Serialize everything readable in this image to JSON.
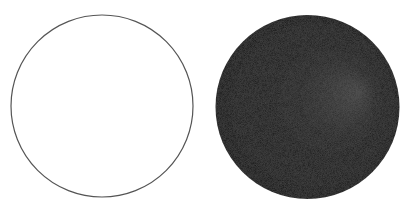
{
  "figure": {
    "width": 411,
    "height": 215,
    "background": "#ffffff",
    "shapes": [
      {
        "kind": "outline-circle",
        "cx": 102,
        "cy": 106,
        "r": 91,
        "fill": "#ffffff",
        "stroke": "#555555",
        "stroke_width": 1.2
      },
      {
        "kind": "shaded-sphere",
        "cx": 307.5,
        "cy": 107,
        "r": 92,
        "base_color": "#0f0f0f",
        "mid_color": "#1c1c1c",
        "highlight_color": "#3c3c3c",
        "highlight_fx": "78%",
        "highlight_fy": "42%"
      }
    ]
  }
}
